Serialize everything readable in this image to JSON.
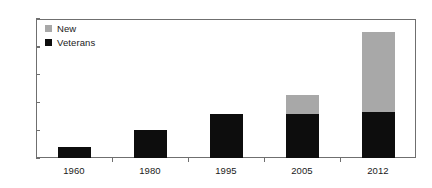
{
  "chart_data": {
    "type": "bar",
    "subtype": "stacked-bar",
    "title": "",
    "subtitle": "",
    "xlabel": "",
    "ylabel": "",
    "categories": [
      "1960",
      "1980",
      "1995",
      "2005",
      "2012"
    ],
    "series": [
      {
        "name": "Veterans",
        "color": "#0d0d0d",
        "values": [
          2,
          5,
          8,
          8,
          8.3
        ]
      },
      {
        "name": "New",
        "color": "#a8a8a8",
        "values": [
          0,
          0,
          0,
          3.3,
          14.3
        ]
      }
    ],
    "totals": [
      2,
      5,
      8,
      11.3,
      22.6
    ],
    "ylim": [
      0,
      25
    ],
    "yticks": [
      0,
      5,
      10,
      15,
      20,
      25
    ],
    "ytick_labels": [
      "0",
      "5",
      "10",
      "15",
      "20",
      "25"
    ],
    "grid": false,
    "legend_position": "top-left",
    "legend": [
      {
        "label": "New",
        "color": "#a8a8a8",
        "swatch": "legend-swatch-new"
      },
      {
        "label": "Veterans",
        "color": "#0d0d0d",
        "swatch": "legend-swatch-veterans"
      }
    ],
    "axis_color": "#6f6f6f",
    "background": "#ffffff"
  }
}
